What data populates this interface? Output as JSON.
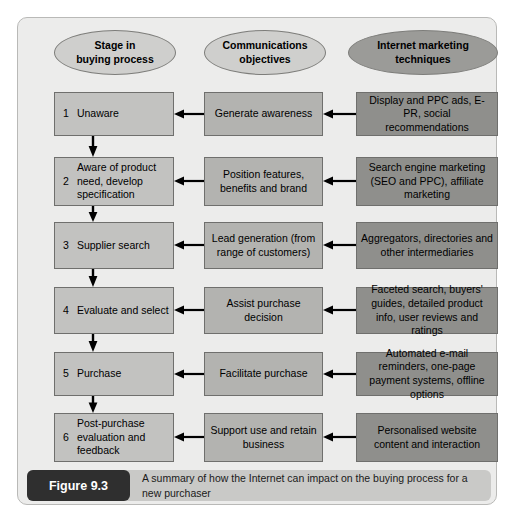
{
  "figure": {
    "number_label": "Figure 9.3",
    "caption": "A summary of how the Internet can impact on the buying process for a new purchaser"
  },
  "columns": [
    {
      "id": "stage",
      "header": "Stage in\nbuying process",
      "header_line1": "Stage in",
      "header_line2": "buying process"
    },
    {
      "id": "comms",
      "header": "Communications\nobjectives",
      "header_line1": "Communications",
      "header_line2": "objectives"
    },
    {
      "id": "tech",
      "header": "Internet marketing\ntechniques",
      "header_line1": "Internet marketing",
      "header_line2": "techniques"
    }
  ],
  "rows": [
    {
      "number": "1",
      "stage": "Unaware",
      "communications_objective": "Generate awareness",
      "internet_marketing_technique": "Display and PPC ads, E-PR, social recommendations"
    },
    {
      "number": "2",
      "stage": "Aware of product need, develop specification",
      "communications_objective": "Position features, benefits and brand",
      "internet_marketing_technique": "Search engine marketing (SEO and PPC), affiliate marketing"
    },
    {
      "number": "3",
      "stage": "Supplier search",
      "communications_objective": "Lead generation (from range of customers)",
      "internet_marketing_technique": "Aggregators, directories and other intermediaries"
    },
    {
      "number": "4",
      "stage": "Evaluate and select",
      "communications_objective": "Assist purchase decision",
      "internet_marketing_technique": "Faceted search, buyers' guides, detailed product info, user reviews and ratings"
    },
    {
      "number": "5",
      "stage": "Purchase",
      "communications_objective": "Facilitate purchase",
      "internet_marketing_technique": "Automated e-mail reminders, one-page payment systems, offline options"
    },
    {
      "number": "6",
      "stage": "Post-purchase evaluation and feedback",
      "communications_objective": "Support use and retain business",
      "internet_marketing_technique": "Personalised website content and interaction"
    }
  ],
  "colors": {
    "page_background": "#ffffff",
    "frame_background": "#ececeb",
    "oval_light": "#cfcfcd",
    "oval_dark": "#9b9b98",
    "stage_box": "#c2c2c0",
    "comms_box": "#b3b3b0",
    "tech_box": "#8f8f8c",
    "arrow": "#000000",
    "caption_bar": "#c9c9c7",
    "figure_badge": "#2f2f2f"
  }
}
